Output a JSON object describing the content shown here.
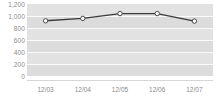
{
  "chart_data": {
    "type": "line",
    "title": "",
    "xlabel": "",
    "ylabel": "",
    "categories": [
      "12/03",
      "12/04",
      "12/05",
      "12/06",
      "12/07"
    ],
    "values": [
      920,
      960,
      1040,
      1040,
      915
    ],
    "series": [
      {
        "name": "series-1",
        "values": [
          920,
          960,
          1040,
          1040,
          915
        ]
      }
    ],
    "ylim": [
      0,
      1200
    ],
    "ytick_labels": [
      "1,200",
      "1,000",
      "800",
      "600",
      "400",
      "200",
      "0"
    ],
    "ytick_values": [
      1200,
      1000,
      800,
      600,
      400,
      200,
      0
    ],
    "grid": true,
    "legend": "none",
    "colors": {
      "line": "#3a3a3a",
      "marker_fill": "#ffffff",
      "marker_stroke": "#4a4a4a",
      "plot_background": "#dcdcdc",
      "band": "#e2e2e2",
      "gridline": "#fbfbfb",
      "tick_label": "#8b8b8b"
    }
  }
}
